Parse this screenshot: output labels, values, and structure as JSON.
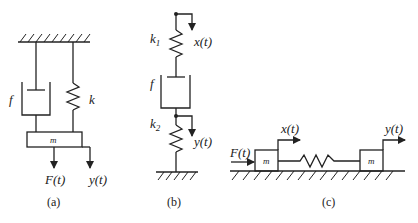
{
  "figures": [
    {
      "caption": "(a)",
      "labels": {
        "damper": "f",
        "spring": "k",
        "mass": "m",
        "force": "F(t)",
        "displacement": "y(t)"
      }
    },
    {
      "caption": "(b)",
      "labels": {
        "spring1": "k",
        "spring1_sub": "1",
        "input": "x(t)",
        "damper": "f",
        "spring2": "k",
        "spring2_sub": "2",
        "output": "y(t)"
      }
    },
    {
      "caption": "(c)",
      "labels": {
        "force": "F(t)",
        "x": "x(t)",
        "y": "y(t)",
        "mass_left": "m",
        "mass_right": "m"
      }
    }
  ]
}
